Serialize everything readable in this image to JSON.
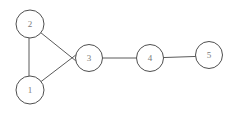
{
  "diagram": {
    "type": "undirected-graph",
    "background_color": "#ffffff",
    "edge_color": "#5a5a5a",
    "node_stroke_color": "#4f4f4f",
    "node_fill_color": "#ffffff",
    "label_color": "#7a7a7a",
    "nodes": [
      {
        "id": "1",
        "label": "1",
        "x": 30,
        "y": 90,
        "r": 14
      },
      {
        "id": "2",
        "label": "2",
        "x": 30,
        "y": 24,
        "r": 14
      },
      {
        "id": "3",
        "label": "3",
        "x": 89,
        "y": 58,
        "r": 13.5
      },
      {
        "id": "4",
        "label": "4",
        "x": 150,
        "y": 58,
        "r": 13.5
      },
      {
        "id": "5",
        "label": "5",
        "x": 209,
        "y": 55,
        "r": 13.5
      }
    ],
    "edges": [
      {
        "from": "2",
        "to": "1",
        "x1": 29,
        "y1": 24,
        "x2": 29,
        "y2": 90
      },
      {
        "from": "2",
        "to": "3",
        "x1": 30,
        "y1": 24,
        "x2": 81,
        "y2": 65
      },
      {
        "from": "1",
        "to": "3",
        "x1": 30,
        "y1": 90,
        "x2": 81,
        "y2": 51
      },
      {
        "from": "3",
        "to": "4",
        "x1": 89,
        "y1": 58,
        "x2": 150,
        "y2": 58
      },
      {
        "from": "4",
        "to": "5",
        "x1": 150,
        "y1": 58,
        "x2": 209,
        "y2": 56
      }
    ]
  }
}
